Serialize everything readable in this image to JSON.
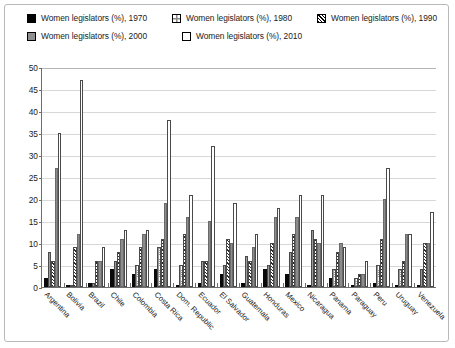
{
  "legend": {
    "items": [
      {
        "label": "Women legislators (%), 1970",
        "key": "1970",
        "swatch": "solid-black-square"
      },
      {
        "label": "Women legislators (%), 1980",
        "key": "1980",
        "swatch": "crosshatch-square"
      },
      {
        "label": "Women legislators (%), 1990",
        "key": "1990",
        "swatch": "diagonal-hatch-square"
      },
      {
        "label": "Women legislators (%), 2000",
        "key": "2000",
        "swatch": "solid-gray-square"
      },
      {
        "label": "Women legislators (%), 2010",
        "key": "2010",
        "swatch": "empty-white-square"
      }
    ]
  },
  "chart_data": {
    "type": "bar",
    "title": "",
    "subtitle": "",
    "xlabel": "",
    "ylabel": "",
    "ylim": [
      0,
      50
    ],
    "yticks": [
      0,
      5,
      10,
      15,
      20,
      25,
      30,
      35,
      40,
      45,
      50
    ],
    "grid": true,
    "legend_position": "top",
    "categories": [
      "Argentina",
      "Bolivia",
      "Brazil",
      "Chile",
      "Colombia",
      "Costa Rica",
      "Dom. Republic",
      "Ecuador",
      "El Salvador",
      "Guatemala",
      "Honduras",
      "Mexico",
      "Nicaragua",
      "Panama",
      "Paraguay",
      "Peru",
      "Uruguay",
      "Venezuela"
    ],
    "series": [
      {
        "name": "Women legislators (%), 1970",
        "values": [
          2,
          0.5,
          1,
          4,
          3,
          4,
          0.5,
          1,
          3,
          1,
          4,
          3,
          0.5,
          2,
          0.5,
          1,
          0.5,
          0.5
        ]
      },
      {
        "name": "Women legislators (%), 1980",
        "values": [
          8,
          0.5,
          1,
          6,
          5,
          9,
          5,
          6,
          5,
          7,
          5,
          8,
          13,
          4,
          2,
          5,
          4,
          4
        ]
      },
      {
        "name": "Women legislators (%), 1990",
        "values": [
          6,
          9,
          6,
          8,
          9,
          11,
          12,
          6,
          11,
          6,
          10,
          12,
          11,
          8,
          3,
          11,
          6,
          10
        ]
      },
      {
        "name": "Women legislators (%), 2000",
        "values": [
          27,
          12,
          6,
          11,
          12,
          19,
          16,
          15,
          10,
          9,
          16,
          16,
          10,
          10,
          3,
          20,
          12,
          10
        ]
      },
      {
        "name": "Women legislators (%), 2010",
        "values": [
          35,
          47,
          9,
          13,
          13,
          38,
          21,
          32,
          19,
          12,
          18,
          21,
          21,
          9,
          6,
          27,
          12,
          17
        ]
      }
    ]
  }
}
